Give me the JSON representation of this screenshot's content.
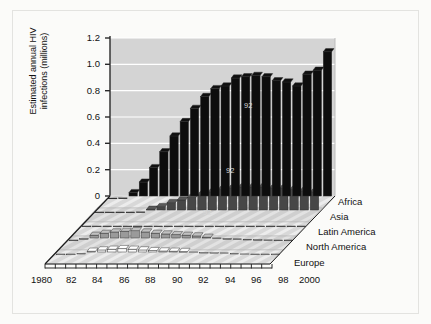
{
  "figure": {
    "background_color": "#fbfbf9",
    "plot_background_color": "#d4d4d4",
    "gridline_color": "#ffffff"
  },
  "axis": {
    "y_title_line1": "Estimated annual HIV",
    "y_title_line2": "infections (millions)",
    "y_ticks": [
      "0",
      "0.2",
      "0.4",
      "0.6",
      "0.8",
      "1.0",
      "1.2"
    ],
    "x_ticks": [
      "1980",
      "82",
      "84",
      "86",
      "88",
      "90",
      "92",
      "94",
      "96",
      "98",
      "2000"
    ]
  },
  "annotations": {
    "africa_upper": "92",
    "africa_lower": "92",
    "asia": "92"
  },
  "chart_data": {
    "type": "bar",
    "title": "",
    "subtitle": "",
    "xlabel": "",
    "ylabel": "Estimated annual HIV infections (millions)",
    "ylim": [
      0,
      1.2
    ],
    "grid": true,
    "legend_position": "right-inline",
    "projection": "3d-ribbon",
    "categories": [
      1980,
      1981,
      1982,
      1983,
      1984,
      1985,
      1986,
      1987,
      1988,
      1989,
      1990,
      1991,
      1992,
      1993,
      1994,
      1995,
      1996,
      1997,
      1998,
      1999,
      2000,
      2001
    ],
    "series": [
      {
        "name": "Africa",
        "color": "#0d0d0d",
        "values": [
          0.005,
          0.01,
          0.05,
          0.13,
          0.24,
          0.36,
          0.48,
          0.59,
          0.69,
          0.78,
          0.84,
          0.86,
          0.92,
          0.93,
          0.94,
          0.93,
          0.9,
          0.89,
          0.86,
          0.95,
          0.98,
          1.12
        ]
      },
      {
        "name": "Asia",
        "color": "#474747",
        "values": [
          0.0,
          0.0,
          0.0,
          0.0,
          0.01,
          0.03,
          0.05,
          0.08,
          0.1,
          0.12,
          0.14,
          0.16,
          0.18,
          0.19,
          0.2,
          0.2,
          0.2,
          0.19,
          0.19,
          0.18,
          0.17,
          0.16
        ]
      },
      {
        "name": "Latin America",
        "color": "#6e6e6e",
        "values": [
          0.0,
          0.0,
          0.0,
          0.0,
          0.0,
          0.0,
          0.0,
          0.0,
          0.0,
          0.0,
          0.0,
          0.0,
          0.0,
          0.0,
          0.0,
          0.0,
          0.0,
          0.0,
          0.0,
          0.0,
          0.0,
          0.0
        ]
      },
      {
        "name": "North America",
        "color": "#9a9a9a",
        "values": [
          0.005,
          0.02,
          0.045,
          0.06,
          0.07,
          0.075,
          0.08,
          0.07,
          0.06,
          0.055,
          0.05,
          0.045,
          0.04,
          0.03,
          0.025,
          0.02,
          0.018,
          0.015,
          0.012,
          0.01,
          0.008,
          0.006
        ]
      },
      {
        "name": "Europe",
        "color": "#fbfbfb",
        "values": [
          0.0,
          0.005,
          0.015,
          0.03,
          0.04,
          0.045,
          0.05,
          0.045,
          0.04,
          0.035,
          0.032,
          0.03,
          0.028,
          0.025,
          0.022,
          0.02,
          0.018,
          0.015,
          0.01,
          0.006,
          0.004,
          0.003
        ]
      }
    ]
  }
}
